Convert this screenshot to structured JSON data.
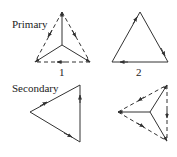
{
  "labels": {
    "primary": "Primary",
    "secondary": "Secondary",
    "fig1": "1",
    "fig2": "2"
  },
  "figures": [
    {
      "id": "primary-wye-delta",
      "type": "wye with dashed delta",
      "number": "1"
    },
    {
      "id": "primary-delta",
      "type": "solid delta",
      "number": "2"
    },
    {
      "id": "secondary-delta",
      "type": "solid delta pointing left"
    },
    {
      "id": "secondary-wye-delta",
      "type": "wye with dashed delta pointing left"
    }
  ],
  "colors": {
    "stroke": "#333333",
    "background": "#ffffff"
  }
}
